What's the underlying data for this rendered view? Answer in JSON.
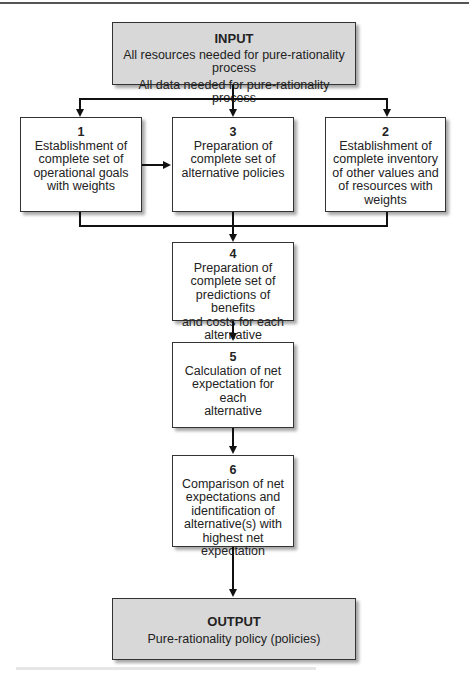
{
  "diagram": {
    "type": "flowchart",
    "input": {
      "title": "INPUT",
      "lines": [
        "All resources needed for pure-rationality process",
        "All data needed for pure-rationality process"
      ]
    },
    "steps": [
      {
        "number": "1",
        "text": "Establishment of\ncomplete set of\noperational goals\nwith weights"
      },
      {
        "number": "3",
        "text": "Preparation of\ncomplete set of\nalternative policies"
      },
      {
        "number": "2",
        "text": "Establishment of\ncomplete inventory\nof other values and\nof resources with\nweights"
      },
      {
        "number": "4",
        "text": "Preparation of\ncomplete set of\npredictions of benefits\nand costs for each\nalternative"
      },
      {
        "number": "5",
        "text": "Calculation of net\nexpectation for each\nalternative"
      },
      {
        "number": "6",
        "text": "Comparison of net\nexpectations and\nidentification of\nalternative(s) with\nhighest net expectation"
      }
    ],
    "output": {
      "title": "OUTPUT",
      "lines": [
        "Pure-rationality policy (policies)"
      ]
    },
    "edges": [
      [
        "INPUT",
        "1"
      ],
      [
        "INPUT",
        "3"
      ],
      [
        "INPUT",
        "2"
      ],
      [
        "1",
        "3"
      ],
      [
        "1",
        "4"
      ],
      [
        "3",
        "4"
      ],
      [
        "2",
        "4"
      ],
      [
        "4",
        "5"
      ],
      [
        "5",
        "6"
      ],
      [
        "6",
        "OUTPUT"
      ]
    ],
    "colors": {
      "io_fill": "#d8d8d8",
      "step_fill": "#ffffff",
      "stroke": "#111111"
    }
  }
}
